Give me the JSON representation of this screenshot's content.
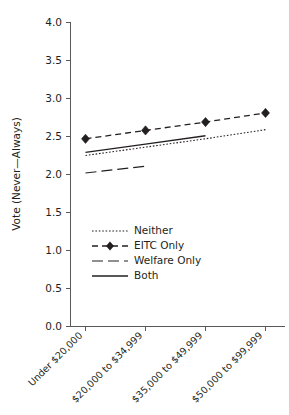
{
  "chart_data": {
    "type": "line",
    "title": "",
    "xlabel": "",
    "ylabel": "Vote (Never—Always)",
    "categories": [
      "Under $20,000",
      "$20,000 to $34,999",
      "$35,000 to $49,999",
      "$50,000 to $99,999"
    ],
    "ylim": [
      0.0,
      4.0
    ],
    "ytick_labels": [
      "0.0",
      "0.5",
      "1.0",
      "1.5",
      "2.0",
      "2.5",
      "3.0",
      "3.5",
      "4.0"
    ],
    "ytick_values": [
      0.0,
      0.5,
      1.0,
      1.5,
      2.0,
      2.5,
      3.0,
      3.5,
      4.0
    ],
    "grid": false,
    "legend_position": "center-left",
    "series": [
      {
        "name": "Neither",
        "style": "dotted",
        "marker": "none",
        "values": [
          2.25,
          2.36,
          2.47,
          2.59
        ]
      },
      {
        "name": "EITC Only",
        "style": "dash-dot",
        "marker": "diamond",
        "values": [
          2.47,
          2.58,
          2.69,
          2.81
        ]
      },
      {
        "name": "Welfare Only",
        "style": "long-dash",
        "marker": "none",
        "values": [
          2.02,
          2.11,
          null,
          null
        ]
      },
      {
        "name": "Both",
        "style": "solid",
        "marker": "none",
        "values": [
          2.29,
          2.4,
          2.51,
          null
        ]
      }
    ]
  },
  "legend": {
    "items": [
      {
        "label": "Neither"
      },
      {
        "label": "EITC Only"
      },
      {
        "label": "Welfare Only"
      },
      {
        "label": "Both"
      }
    ]
  },
  "colors": {
    "ink": "#231f20",
    "axis": "#58595b",
    "background": "#ffffff"
  }
}
